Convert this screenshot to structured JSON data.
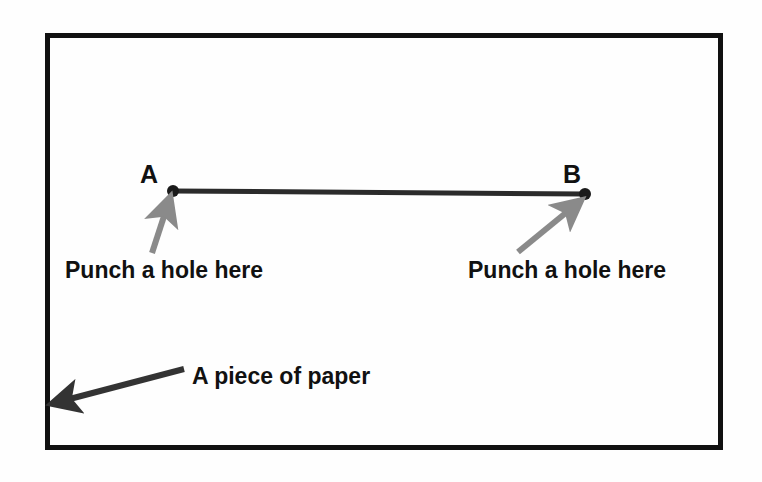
{
  "figure": {
    "background_color": "#fefefe",
    "paper": {
      "name": "A piece of paper",
      "border_color": "#111111",
      "border_width_px": 5,
      "rect": {
        "x": 45,
        "y": 33,
        "width": 678,
        "height": 417
      }
    },
    "segment": {
      "label": "line segment AB",
      "color": "#2b2b2b",
      "width_px": 5,
      "from": {
        "label": "A",
        "x": 173,
        "y": 191
      },
      "to": {
        "label": "B",
        "x": 585,
        "y": 194
      }
    },
    "endpoints": [
      {
        "id": "A",
        "label": "A",
        "dot_x": 173,
        "dot_y": 191,
        "label_x": 140,
        "label_y": 183,
        "dot_color": "#1a1a1a",
        "dot_radius": 6
      },
      {
        "id": "B",
        "label": "B",
        "dot_x": 585,
        "dot_y": 194,
        "label_x": 563,
        "label_y": 183,
        "dot_color": "#1a1a1a",
        "dot_radius": 6
      }
    ],
    "annotations": [
      {
        "id": "punch-left",
        "text": "Punch a hole here",
        "text_x": 65,
        "text_y": 278,
        "arrow_color": "#8a8a8a",
        "arrow_width_px": 6,
        "arrow_tail": {
          "x": 152,
          "y": 253
        },
        "arrow_head": {
          "x": 167,
          "y": 201
        }
      },
      {
        "id": "punch-right",
        "text": "Punch a hole here",
        "text_x": 468,
        "text_y": 278,
        "arrow_color": "#8a8a8a",
        "arrow_width_px": 6,
        "arrow_tail": {
          "x": 518,
          "y": 252
        },
        "arrow_head": {
          "x": 578,
          "y": 202
        }
      },
      {
        "id": "paper-callout",
        "text": "A piece of paper",
        "text_x": 192,
        "text_y": 384,
        "arrow_color": "#333333",
        "arrow_width_px": 6,
        "arrow_tail": {
          "x": 184,
          "y": 369
        },
        "arrow_head": {
          "x": 56,
          "y": 403
        }
      }
    ]
  }
}
